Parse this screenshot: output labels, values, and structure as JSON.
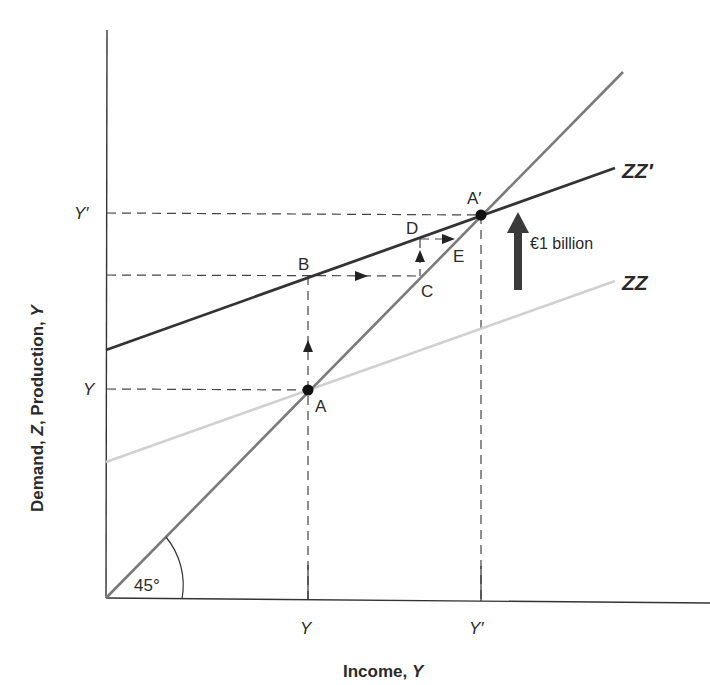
{
  "diagram": {
    "type": "keynesian-cross-multiplier",
    "axes": {
      "y_title_parts": [
        "Demand, ",
        "Z",
        ", Production, ",
        "Y"
      ],
      "x_title_parts": [
        "Income, ",
        "Y"
      ],
      "y_ticks": [
        "Y′",
        "Y"
      ],
      "x_ticks": [
        "Y",
        "Y′"
      ]
    },
    "curves": {
      "zz_prime_label": "ZZ′",
      "zz_label": "ZZ",
      "angle_label": "45°"
    },
    "points": {
      "A": "A",
      "A_prime": "A′",
      "B": "B",
      "C": "C",
      "D": "D",
      "E": "E"
    },
    "shift_annotation": "€1 billion",
    "colors": {
      "axis": "#333333",
      "zz_prime": "#333333",
      "zz": "#cfcfcf",
      "line_45": "#7a7a7a",
      "dashed": "#444444",
      "shift_arrow": "#3a3a3a"
    }
  }
}
